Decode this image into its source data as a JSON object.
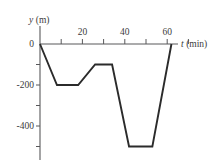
{
  "figure": {
    "kind": "line-graph",
    "background": "#ffffff",
    "ink_color": "#2b2b2b",
    "axis_color": "#58585a"
  },
  "labels": {
    "yaxis_name": "y (m)",
    "yaxis_name_symbol": "y",
    "yaxis_name_unit": "(m)",
    "xaxis_name": "t (min)",
    "xaxis_name_symbol": "t",
    "xaxis_name_unit": "(min)",
    "origin": "0",
    "y_ticks": [
      "0",
      "-200",
      "-400"
    ],
    "x_ticks": [
      "20",
      "40",
      "60"
    ]
  },
  "chart_data": {
    "type": "line",
    "title": "",
    "xlabel": "t (min)",
    "ylabel": "y (m)",
    "xlim": [
      0,
      72
    ],
    "ylim": [
      -560,
      20
    ],
    "grid": false,
    "legend": "none",
    "x_tick_values": [
      20,
      40,
      60
    ],
    "x_minor_tick_values": [
      10,
      30,
      50,
      70
    ],
    "y_tick_values": [
      0,
      -200,
      -400
    ],
    "y_minor_tick_values": [
      -100,
      -300,
      -500
    ],
    "series": [
      {
        "name": "y(t)",
        "x": [
          0,
          8,
          18,
          26,
          34,
          42,
          53,
          62
        ],
        "values": [
          0,
          -200,
          -200,
          -100,
          -100,
          -500,
          -500,
          0
        ]
      }
    ],
    "annotations": []
  },
  "geometry": {
    "origin_px": {
      "x": 40,
      "y": 44
    },
    "px_per_minute": 2.12,
    "px_per_meter": 0.205,
    "vertices_px": [
      {
        "x": 40,
        "y": 44
      },
      {
        "x": 58,
        "y": 86
      },
      {
        "x": 78,
        "y": 86
      },
      {
        "x": 95,
        "y": 65
      },
      {
        "x": 112,
        "y": 65
      },
      {
        "x": 130,
        "y": 136
      },
      {
        "x": 152,
        "y": 136
      },
      {
        "x": 172,
        "y": 44
      }
    ],
    "x_axis_px": {
      "x1": 40,
      "x2": 178,
      "y": 44
    },
    "y_axis_px": {
      "x": 40,
      "y1": 26,
      "y2": 160
    },
    "x_tick_px": [
      50,
      58,
      72,
      80,
      92,
      100,
      113,
      122,
      134,
      142,
      155,
      168
    ],
    "x_major_tick_px": [
      58,
      72,
      92,
      100,
      122,
      134,
      155,
      168
    ],
    "y_tick_px": [
      44,
      65,
      86,
      106,
      126,
      146
    ]
  }
}
